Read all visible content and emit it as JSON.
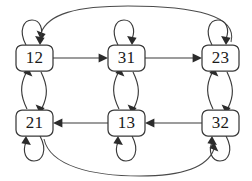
{
  "diagram": {
    "type": "directed-graph",
    "canvas": {
      "width": 252,
      "height": 181,
      "background": "#ffffff"
    },
    "style": {
      "node_fill": "#ffffff",
      "node_stroke": "#3a3a3a",
      "edge_stroke": "#3a3a3a",
      "label_color": "#1a1a1a"
    },
    "nodes": [
      {
        "id": "n12",
        "label": "12",
        "row": "top",
        "col": "left",
        "cx": 34,
        "cy": 58
      },
      {
        "id": "n31",
        "label": "31",
        "row": "top",
        "col": "middle",
        "cx": 126,
        "cy": 58
      },
      {
        "id": "n23",
        "label": "23",
        "row": "top",
        "col": "right",
        "cx": 220,
        "cy": 58
      },
      {
        "id": "n21",
        "label": "21",
        "row": "bottom",
        "col": "left",
        "cx": 34,
        "cy": 123
      },
      {
        "id": "n13",
        "label": "13",
        "row": "bottom",
        "col": "middle",
        "cx": 126,
        "cy": 123
      },
      {
        "id": "n32",
        "label": "32",
        "row": "bottom",
        "col": "right",
        "cx": 220,
        "cy": 123
      }
    ],
    "edges": [
      {
        "from": "12",
        "to": "31",
        "kind": "straight-horizontal",
        "direction": "right"
      },
      {
        "from": "31",
        "to": "23",
        "kind": "straight-horizontal",
        "direction": "right"
      },
      {
        "from": "32",
        "to": "13",
        "kind": "straight-horizontal",
        "direction": "left"
      },
      {
        "from": "13",
        "to": "21",
        "kind": "straight-horizontal",
        "direction": "left"
      },
      {
        "from": "12",
        "to": "21",
        "kind": "curved-vertical",
        "direction": "down"
      },
      {
        "from": "21",
        "to": "12",
        "kind": "curved-vertical",
        "direction": "up"
      },
      {
        "from": "31",
        "to": "13",
        "kind": "curved-vertical",
        "direction": "down"
      },
      {
        "from": "13",
        "to": "31",
        "kind": "curved-vertical",
        "direction": "up"
      },
      {
        "from": "23",
        "to": "32",
        "kind": "curved-vertical",
        "direction": "down"
      },
      {
        "from": "32",
        "to": "23",
        "kind": "curved-vertical",
        "direction": "up"
      },
      {
        "from": "12",
        "to": "12",
        "kind": "self-loop",
        "position": "above"
      },
      {
        "from": "31",
        "to": "31",
        "kind": "self-loop",
        "position": "above"
      },
      {
        "from": "23",
        "to": "23",
        "kind": "self-loop",
        "position": "above"
      },
      {
        "from": "21",
        "to": "21",
        "kind": "self-loop",
        "position": "below"
      },
      {
        "from": "13",
        "to": "13",
        "kind": "self-loop",
        "position": "below"
      },
      {
        "from": "32",
        "to": "32",
        "kind": "self-loop",
        "position": "below"
      },
      {
        "from": "23",
        "to": "12",
        "kind": "long-arc",
        "position": "over-top"
      },
      {
        "from": "21",
        "to": "32",
        "kind": "long-arc",
        "position": "under-bottom"
      }
    ]
  }
}
